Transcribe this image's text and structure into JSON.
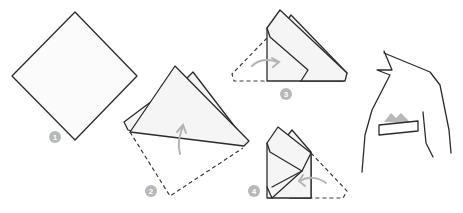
{
  "colors": {
    "stroke": "#2b2b2b",
    "paper": "#f5f5f5",
    "badge": "#b8b8b8",
    "arrow": "#b4b4b4",
    "background": "#ffffff"
  },
  "steps": [
    {
      "number": "1",
      "description": "Square laid out as a diamond"
    },
    {
      "number": "2",
      "description": "Fold bottom corner up, slightly offset to the left of the top point"
    },
    {
      "number": "3",
      "description": "Fold left corner inward"
    },
    {
      "number": "4",
      "description": "Fold right corner inward"
    }
  ],
  "final": {
    "description": "Jacket with pocket square showing peaks in breast pocket"
  }
}
